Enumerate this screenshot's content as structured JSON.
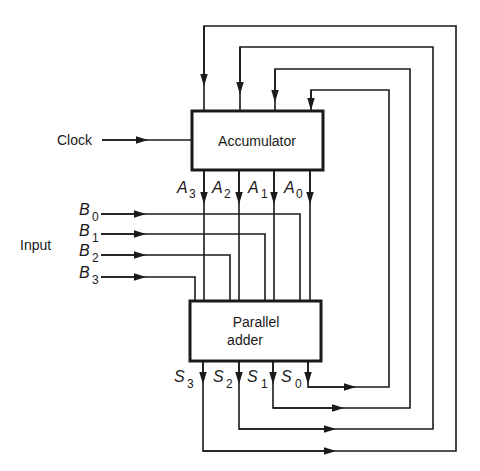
{
  "diagram": {
    "blocks": {
      "accumulator": {
        "label": "Accumulator"
      },
      "parallel_adder": {
        "label_line1": "Parallel",
        "label_line2": "adder"
      }
    },
    "clock": {
      "label": "Clock"
    },
    "input": {
      "label": "Input"
    },
    "accumulator_outputs": [
      {
        "letter": "A",
        "sub": "3"
      },
      {
        "letter": "A",
        "sub": "2"
      },
      {
        "letter": "A",
        "sub": "1"
      },
      {
        "letter": "A",
        "sub": "0"
      }
    ],
    "inputs_b": [
      {
        "letter": "B",
        "sub": "0"
      },
      {
        "letter": "B",
        "sub": "1"
      },
      {
        "letter": "B",
        "sub": "2"
      },
      {
        "letter": "B",
        "sub": "3"
      }
    ],
    "sum_outputs": [
      {
        "letter": "S",
        "sub": "3"
      },
      {
        "letter": "S",
        "sub": "2"
      },
      {
        "letter": "S",
        "sub": "1"
      },
      {
        "letter": "S",
        "sub": "0"
      }
    ],
    "colors": {
      "line": "#1a1a1a",
      "background": "#ffffff"
    }
  }
}
